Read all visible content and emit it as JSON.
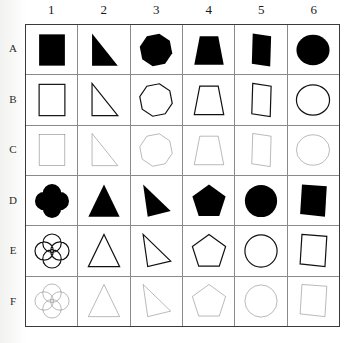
{
  "figure": {
    "type": "shape-matrix-grid",
    "rows": 6,
    "cols": 6,
    "background_color": "#ffffff",
    "grid_line_color": "#8a8a8a",
    "frame_color": "#3a3a3a",
    "fill_color": "#000000"
  },
  "column_headers": [
    "1",
    "2",
    "3",
    "4",
    "5",
    "6"
  ],
  "row_headers": [
    "A",
    "B",
    "C",
    "D",
    "E",
    "F"
  ],
  "row_styles": [
    {
      "row": "A",
      "render": "filled",
      "stroke_width": 0,
      "stroke_color": "#000000",
      "fill": "#000000"
    },
    {
      "row": "B",
      "render": "outline",
      "stroke_width": 2.6,
      "stroke_color": "#111111",
      "fill": "none"
    },
    {
      "row": "C",
      "render": "outline",
      "stroke_width": 0.9,
      "stroke_color": "#555555",
      "fill": "none"
    },
    {
      "row": "D",
      "render": "filled",
      "stroke_width": 0,
      "stroke_color": "#000000",
      "fill": "#000000"
    },
    {
      "row": "E",
      "render": "outline",
      "stroke_width": 2.6,
      "stroke_color": "#111111",
      "fill": "none"
    },
    {
      "row": "F",
      "render": "outline",
      "stroke_width": 0.9,
      "stroke_color": "#555555",
      "fill": "none"
    }
  ],
  "cells": [
    {
      "row": "A",
      "col": "1",
      "shape": "square",
      "label": "filled square"
    },
    {
      "row": "A",
      "col": "2",
      "shape": "right-triangle",
      "label": "filled right triangle"
    },
    {
      "row": "A",
      "col": "3",
      "shape": "heptagon",
      "label": "filled heptagon"
    },
    {
      "row": "A",
      "col": "4",
      "shape": "trapezoid",
      "label": "filled trapezoid"
    },
    {
      "row": "A",
      "col": "5",
      "shape": "slanted-quad",
      "label": "filled slanted quadrilateral"
    },
    {
      "row": "A",
      "col": "6",
      "shape": "ellipse",
      "label": "filled ellipse"
    },
    {
      "row": "B",
      "col": "1",
      "shape": "square",
      "label": "thick outline square"
    },
    {
      "row": "B",
      "col": "2",
      "shape": "right-triangle",
      "label": "thick outline right triangle"
    },
    {
      "row": "B",
      "col": "3",
      "shape": "heptagon",
      "label": "thick outline heptagon"
    },
    {
      "row": "B",
      "col": "4",
      "shape": "trapezoid",
      "label": "thick outline trapezoid"
    },
    {
      "row": "B",
      "col": "5",
      "shape": "slanted-quad",
      "label": "thick outline slanted quadrilateral"
    },
    {
      "row": "B",
      "col": "6",
      "shape": "ellipse",
      "label": "thick outline ellipse"
    },
    {
      "row": "C",
      "col": "1",
      "shape": "square",
      "label": "thin outline square"
    },
    {
      "row": "C",
      "col": "2",
      "shape": "right-triangle",
      "label": "thin outline right triangle"
    },
    {
      "row": "C",
      "col": "3",
      "shape": "heptagon",
      "label": "thin outline heptagon"
    },
    {
      "row": "C",
      "col": "4",
      "shape": "trapezoid",
      "label": "thin outline trapezoid"
    },
    {
      "row": "C",
      "col": "5",
      "shape": "slanted-quad",
      "label": "thin outline slanted quadrilateral"
    },
    {
      "row": "C",
      "col": "6",
      "shape": "ellipse",
      "label": "thin outline ellipse"
    },
    {
      "row": "D",
      "col": "1",
      "shape": "quatrefoil",
      "label": "filled quatrefoil"
    },
    {
      "row": "D",
      "col": "2",
      "shape": "triangle",
      "label": "filled triangle"
    },
    {
      "row": "D",
      "col": "3",
      "shape": "scalene-triangle",
      "label": "filled scalene triangle"
    },
    {
      "row": "D",
      "col": "4",
      "shape": "pentagon",
      "label": "filled pentagon"
    },
    {
      "row": "D",
      "col": "5",
      "shape": "circle",
      "label": "filled circle"
    },
    {
      "row": "D",
      "col": "6",
      "shape": "slanted-square",
      "label": "filled slanted square"
    },
    {
      "row": "E",
      "col": "1",
      "shape": "quatrefoil",
      "label": "thick outline quatrefoil"
    },
    {
      "row": "E",
      "col": "2",
      "shape": "triangle",
      "label": "thick outline triangle"
    },
    {
      "row": "E",
      "col": "3",
      "shape": "scalene-triangle",
      "label": "thick outline scalene triangle"
    },
    {
      "row": "E",
      "col": "4",
      "shape": "pentagon",
      "label": "thick outline pentagon"
    },
    {
      "row": "E",
      "col": "5",
      "shape": "circle",
      "label": "thick outline circle"
    },
    {
      "row": "E",
      "col": "6",
      "shape": "slanted-square",
      "label": "thick outline slanted square"
    },
    {
      "row": "F",
      "col": "1",
      "shape": "quatrefoil",
      "label": "thin outline quatrefoil"
    },
    {
      "row": "F",
      "col": "2",
      "shape": "triangle",
      "label": "thin outline triangle"
    },
    {
      "row": "F",
      "col": "3",
      "shape": "scalene-triangle",
      "label": "thin outline scalene triangle"
    },
    {
      "row": "F",
      "col": "4",
      "shape": "pentagon",
      "label": "thin outline pentagon"
    },
    {
      "row": "F",
      "col": "5",
      "shape": "circle",
      "label": "thin outline circle"
    },
    {
      "row": "F",
      "col": "6",
      "shape": "slanted-square",
      "label": "thin outline slanted square"
    }
  ]
}
